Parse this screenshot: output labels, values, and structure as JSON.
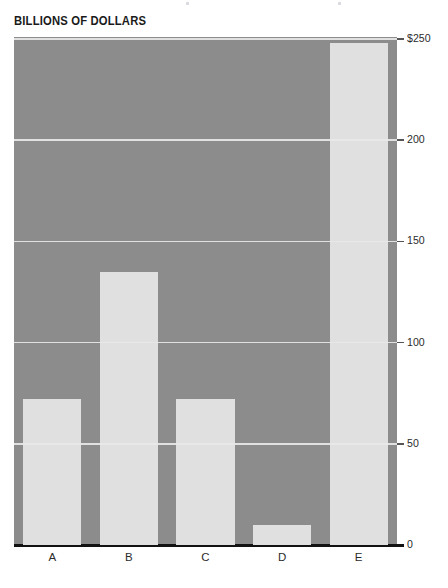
{
  "chart_data": {
    "type": "bar",
    "title": "BILLIONS OF DOLLARS",
    "subtitle": "",
    "xlabel": "",
    "ylabel": "",
    "categories": [
      "A",
      "B",
      "C",
      "D",
      "E"
    ],
    "values": [
      72,
      135,
      72,
      10,
      248
    ],
    "series": [
      {
        "name": "Billions of dollars",
        "values": [
          72,
          135,
          72,
          10,
          248
        ]
      }
    ],
    "ylim": [
      0,
      251
    ],
    "yticks": [
      0,
      50,
      100,
      150,
      200,
      250
    ],
    "ytick_labels": [
      "0",
      "50",
      "100",
      "150",
      "200",
      "$250"
    ],
    "grid": true,
    "grid_axis": "y",
    "legend": false,
    "legend_position": "none",
    "y_axis_position": "right",
    "colors": {
      "plot_background": "#8c8c8c",
      "bar_fill": "#dfe0df",
      "gridline": "#e8e8e8",
      "axis_line": "#121212",
      "text": "#2b2b2b",
      "title_text": "#1a1a1a",
      "page_background": "#ffffff"
    }
  }
}
